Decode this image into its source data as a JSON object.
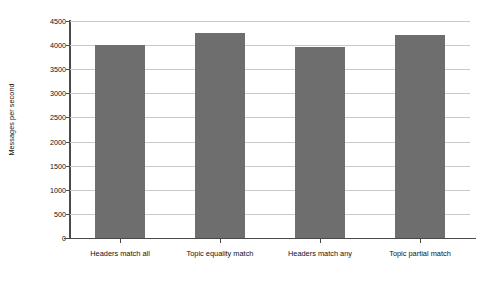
{
  "chart_data": {
    "type": "bar",
    "title": "",
    "xlabel": "",
    "ylabel": "Messages per second",
    "categories": [
      "Headers match all",
      "Topic equality match",
      "Headers match any",
      "Topic partial match"
    ],
    "values": [
      4000,
      4250,
      3960,
      4210
    ],
    "ylim": [
      0,
      4500
    ],
    "ytick_values": [
      0,
      500,
      1000,
      1500,
      2000,
      2500,
      3000,
      3500,
      4000,
      4500
    ],
    "ytick_labels": [
      "0",
      "500",
      "1000",
      "1500",
      "2000",
      "2500",
      "3000",
      "3500",
      "4000",
      "4500"
    ],
    "grid": true,
    "legend": false,
    "legend_position": "none",
    "bar_color": "#6e6e6e",
    "gridline_color": "#c9c9c9",
    "axis_color": "#4a4a4a",
    "background_color": "#ffffff"
  }
}
